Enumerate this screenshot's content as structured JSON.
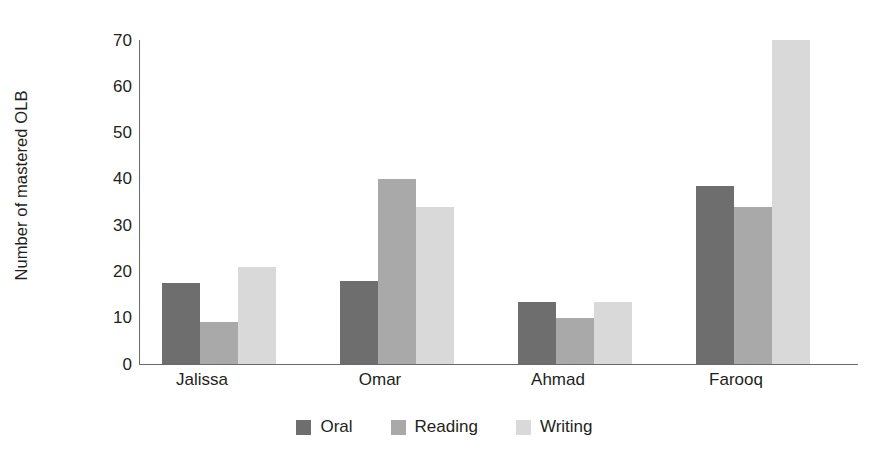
{
  "chart_data": {
    "type": "bar",
    "title": "",
    "xlabel": "",
    "ylabel": "Number of mastered OLB",
    "categories": [
      "Jalissa",
      "Omar",
      "Ahmad",
      "Farooq"
    ],
    "series": [
      {
        "name": "Oral",
        "color": "#6e6e6e",
        "values": [
          17.5,
          18,
          13.5,
          38.5
        ]
      },
      {
        "name": "Reading",
        "color": "#a9a9a9",
        "values": [
          9,
          40,
          10,
          34
        ]
      },
      {
        "name": "Writing",
        "color": "#d9d9d9",
        "values": [
          21,
          34,
          13.5,
          70
        ]
      }
    ],
    "ylim": [
      0,
      70
    ],
    "yticks": [
      "0",
      "10",
      "20",
      "30",
      "40",
      "50",
      "60",
      "70"
    ],
    "grid": false,
    "legend_position": "bottom",
    "legend": [
      "Oral",
      "Reading",
      "Writing"
    ]
  },
  "axis": {
    "y_title": "Number of mastered OLB",
    "tick_70": "70",
    "tick_60": "60",
    "tick_50": "50",
    "tick_40": "40",
    "tick_30": "30",
    "tick_20": "20",
    "tick_10": "10",
    "tick_0": "0"
  },
  "categories": {
    "c0": "Jalissa",
    "c1": "Omar",
    "c2": "Ahmad",
    "c3": "Farooq"
  },
  "legend": {
    "oral": "Oral",
    "reading": "Reading",
    "writing": "Writing"
  }
}
